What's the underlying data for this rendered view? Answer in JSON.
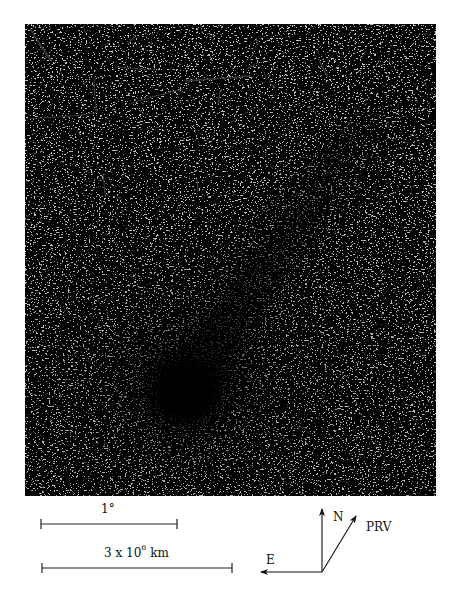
{
  "figure": {
    "photo": {
      "subject": "comet",
      "description": "Negative photographic plate of a comet: dark coma lower-left with ion tail streaming up and to the right, dense star field background",
      "background_color": "#b9b9b9",
      "coma_color": "#050505",
      "nucleus_center_px": [
        185,
        390
      ]
    },
    "scale_bars": [
      {
        "label": "1°",
        "x1": 41,
        "x2": 177,
        "y": 524
      },
      {
        "label_main": "3 x 10",
        "label_exp": "6",
        "label_unit": " km",
        "x1": 42,
        "x2": 232,
        "y": 568
      }
    ],
    "compass": {
      "origin": [
        322,
        572
      ],
      "arrows": [
        {
          "label": "N",
          "tip": [
            322,
            509
          ]
        },
        {
          "label": "E",
          "tip": [
            261,
            572
          ]
        },
        {
          "label": "PRV",
          "tip": [
            356,
            516
          ]
        }
      ]
    }
  }
}
